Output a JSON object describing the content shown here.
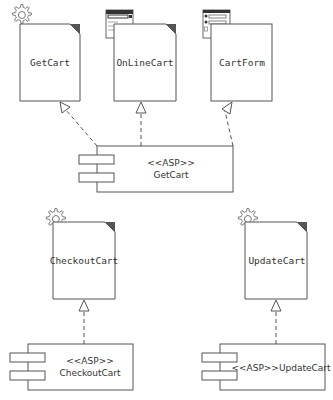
{
  "diagram": {
    "type": "uml-component-diagram",
    "colors": {
      "line": "#555555",
      "fold": "#555555",
      "fill": "#ffffff",
      "icon": "#777777",
      "text": "#333333"
    },
    "documents": [
      {
        "id": "getcart_doc",
        "label": "GetCart",
        "icon": "gear-icon",
        "dog_ear": true
      },
      {
        "id": "onlinecart_doc",
        "label": "OnLineCart",
        "icon": "web-page-icon",
        "dog_ear": true
      },
      {
        "id": "cartform_doc",
        "label": "CartForm",
        "icon": "form-icon",
        "dog_ear": false
      },
      {
        "id": "checkoutcart_doc",
        "label": "CheckoutCart",
        "icon": "gear-icon",
        "dog_ear": true
      },
      {
        "id": "updatecart_doc",
        "label": "UpdateCart",
        "icon": "gear-icon",
        "dog_ear": true
      }
    ],
    "components": [
      {
        "id": "getcart_comp",
        "stereotype": "<<ASP>>",
        "name": "GetCart"
      },
      {
        "id": "checkoutcart_comp",
        "stereotype": "<<ASP>>",
        "name": "CheckoutCart"
      },
      {
        "id": "updatecart_comp",
        "label": "<<ASP>>UpdateCart"
      }
    ],
    "dependencies": [
      {
        "from": "getcart_comp",
        "to": "getcart_doc",
        "style": "dashed",
        "arrow": "hollow-triangle"
      },
      {
        "from": "getcart_comp",
        "to": "onlinecart_doc",
        "style": "dashed",
        "arrow": "hollow-triangle"
      },
      {
        "from": "getcart_comp",
        "to": "cartform_doc",
        "style": "dashed",
        "arrow": "hollow-triangle"
      },
      {
        "from": "checkoutcart_comp",
        "to": "checkoutcart_doc",
        "style": "dashed",
        "arrow": "hollow-triangle"
      },
      {
        "from": "updatecart_comp",
        "to": "updatecart_doc",
        "style": "dashed",
        "arrow": "hollow-triangle"
      }
    ]
  }
}
